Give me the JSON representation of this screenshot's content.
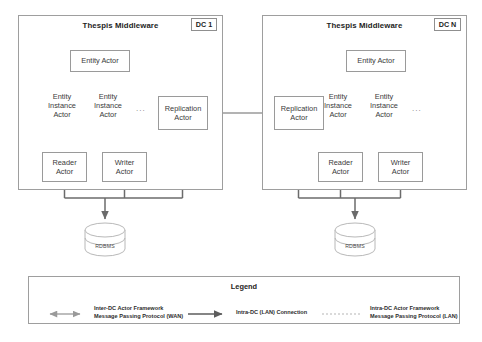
{
  "diagram": {
    "colors": {
      "box_border": "#9a9a9a",
      "panel_border": "#9e9e9e",
      "lan_connection": "#6b6b6b",
      "wan_arrow": "#9a9a9a",
      "actor_protocol": "#b5b5b5",
      "text": "#2b2b2b",
      "background": "#ffffff"
    }
  },
  "datacenters": [
    {
      "id": "dc1",
      "title": "Thespis Middleware",
      "tag": "DC 1",
      "entity_actor": "Entity Actor",
      "entity_instances": [
        "Entity\nInstance\nActor",
        "Entity\nInstance\nActor"
      ],
      "ellipsis": "...",
      "replication_actor": "Replication\nActor",
      "reader_actor": "Reader\nActor",
      "writer_actor": "Writer\nActor",
      "database": "RDBMS"
    },
    {
      "id": "dcn",
      "title": "Thespis Middleware",
      "tag": "DC N",
      "entity_actor": "Entity Actor",
      "entity_instances": [
        "Entity\nInstance\nActor",
        "Entity\nInstance\nActor"
      ],
      "ellipsis": "...",
      "replication_actor": "Replication\nActor",
      "reader_actor": "Reader\nActor",
      "writer_actor": "Writer\nActor",
      "database": "RDBMS"
    }
  ],
  "legend": {
    "title": "Legend",
    "entries": [
      {
        "id": "inter-dc-wan",
        "style": "double-arrow-solid-gray",
        "label": "Inter-DC Actor Framework\nMessage Passing Protocol (WAN)"
      },
      {
        "id": "intra-dc-lan",
        "style": "single-arrow-solid-dark",
        "label": "Intra-DC (LAN) Connection"
      },
      {
        "id": "intra-dc-actor-lan",
        "style": "dotted-line",
        "label": "Intra-DC Actor Framework\nMessage Passing Protocol (LAN)"
      }
    ]
  }
}
